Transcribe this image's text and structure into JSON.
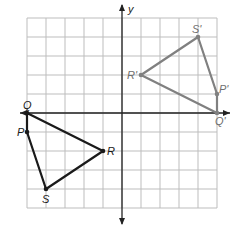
{
  "diagram": {
    "type": "coordinate-plane-transformation",
    "axes": {
      "x_label": "x",
      "y_label": "y",
      "grid": {
        "x_min": -5,
        "x_max": 5,
        "y_min": -5,
        "y_max": 5,
        "step": 1
      }
    },
    "colors": {
      "grid": "#bdbdbd",
      "axis": "#222222",
      "original": "#1a1a1a",
      "image": "#808080",
      "label_original": "#1a1a1a",
      "label_image": "#707070"
    },
    "original_figure": {
      "name": "PQRS",
      "vertices": [
        {
          "label": "Q",
          "x": -5,
          "y": 0
        },
        {
          "label": "P",
          "x": -5,
          "y": -1
        },
        {
          "label": "S",
          "x": -4,
          "y": -4
        },
        {
          "label": "R",
          "x": -1,
          "y": -2
        }
      ]
    },
    "image_figure": {
      "name": "P'Q'R'S'",
      "vertices": [
        {
          "label": "R'",
          "x": 1,
          "y": 2
        },
        {
          "label": "S'",
          "x": 4,
          "y": 4
        },
        {
          "label": "P'",
          "x": 5,
          "y": 1
        },
        {
          "label": "Q'",
          "x": 5,
          "y": 0
        }
      ]
    }
  }
}
